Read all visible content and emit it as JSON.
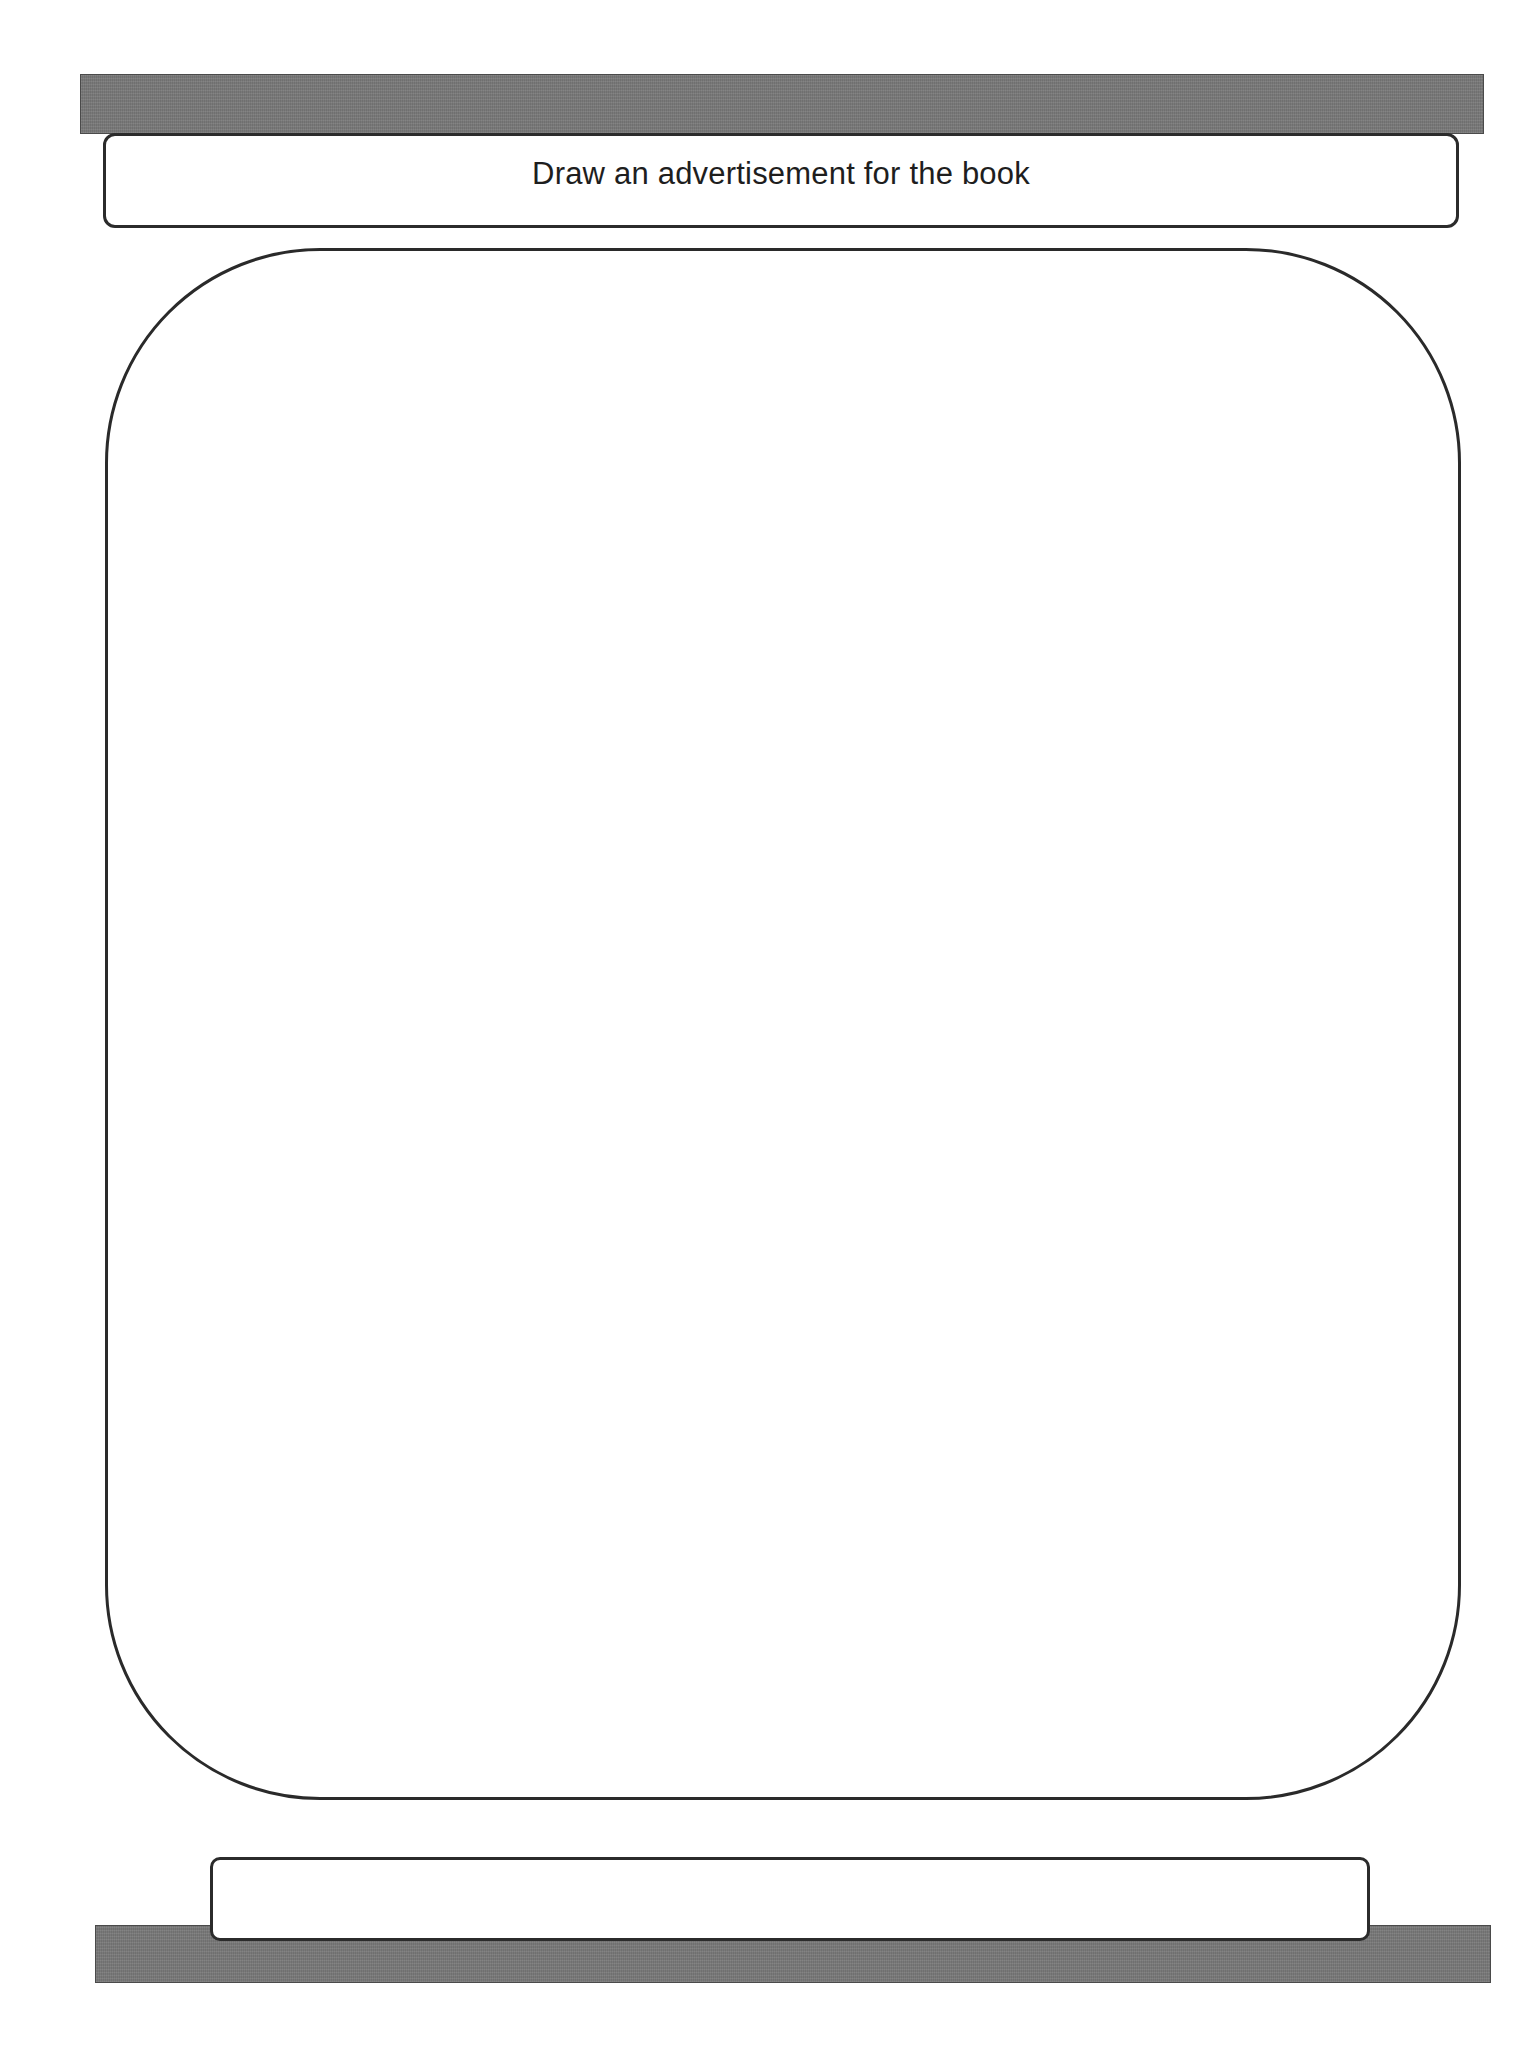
{
  "worksheet": {
    "title_prompt": "Draw an advertisement for the book",
    "drawing_area": {
      "content": ""
    },
    "caption_box": {
      "content": ""
    }
  },
  "colors": {
    "bar_gray": "#7a7a7a",
    "border": "#2b2b2b",
    "background": "#ffffff",
    "text": "#1e1e1e"
  }
}
